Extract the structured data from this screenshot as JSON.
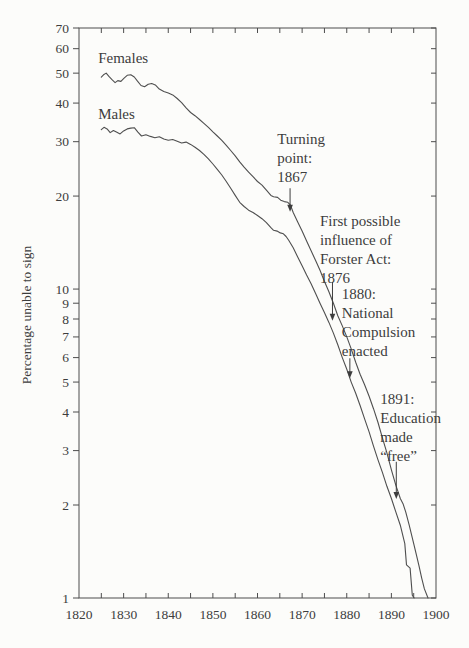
{
  "chart_data": {
    "type": "line",
    "title": "",
    "xlabel": "",
    "ylabel": "Percentage unable to sign",
    "xlim": [
      1820,
      1900
    ],
    "ylim": [
      1,
      70
    ],
    "yscale": "log",
    "grid": false,
    "legend_position": "inline-labels",
    "x_ticks_labeled": [
      1820,
      1830,
      1840,
      1850,
      1860,
      1870,
      1880,
      1890,
      1900
    ],
    "x_ticks_all": [
      1825,
      1830,
      1835,
      1840,
      1845,
      1850,
      1855,
      1860,
      1865,
      1870,
      1875,
      1880,
      1885,
      1890,
      1895
    ],
    "y_ticks": [
      70,
      60,
      50,
      40,
      30,
      20,
      10,
      9,
      8,
      7,
      6,
      5,
      4,
      3,
      2,
      1
    ],
    "colors": {
      "line": "#4f4f4f",
      "frame": "#4d4d4d",
      "text": "#3d3d3d",
      "background": "#fcfcfa"
    },
    "series": [
      {
        "name": "Females",
        "label_anchor": {
          "year": 1824.3,
          "value": 59.5
        },
        "points": [
          [
            1825,
            48.5
          ],
          [
            1825.5,
            49.4
          ],
          [
            1826.1,
            50
          ],
          [
            1826.7,
            48.8
          ],
          [
            1827.4,
            47.6
          ],
          [
            1828.1,
            46.6
          ],
          [
            1828.7,
            47.3
          ],
          [
            1829.4,
            47
          ],
          [
            1830.1,
            48.2
          ],
          [
            1830.8,
            49.2
          ],
          [
            1831.6,
            49.4
          ],
          [
            1832.4,
            48.6
          ],
          [
            1833.1,
            47.1
          ],
          [
            1833.9,
            45.6
          ],
          [
            1834.7,
            45.2
          ],
          [
            1835.5,
            46
          ],
          [
            1836.3,
            46.3
          ],
          [
            1837.1,
            45.8
          ],
          [
            1838,
            44.4
          ],
          [
            1839,
            43.6
          ],
          [
            1840,
            43.1
          ],
          [
            1841,
            42.5
          ],
          [
            1842,
            41.4
          ],
          [
            1843,
            40.1
          ],
          [
            1844,
            38.6
          ],
          [
            1845,
            37.3
          ],
          [
            1846,
            36.4
          ],
          [
            1847,
            35.4
          ],
          [
            1848,
            34.4
          ],
          [
            1849,
            33.4
          ],
          [
            1850,
            32.3
          ],
          [
            1851,
            31.3
          ],
          [
            1852,
            30.3
          ],
          [
            1853,
            29.2
          ],
          [
            1854,
            28.1
          ],
          [
            1855,
            27
          ],
          [
            1856,
            25.8
          ],
          [
            1857,
            24.8
          ],
          [
            1858,
            23.9
          ],
          [
            1859,
            23.1
          ],
          [
            1860,
            22.3
          ],
          [
            1861,
            21.7
          ],
          [
            1862,
            20.9
          ],
          [
            1863,
            20.1
          ],
          [
            1863.6,
            19.9
          ],
          [
            1864.5,
            19.8
          ],
          [
            1865.2,
            19.4
          ],
          [
            1866,
            19.2
          ],
          [
            1866.8,
            19.1
          ],
          [
            1867.4,
            18.7
          ],
          [
            1868,
            17.7
          ],
          [
            1869,
            16.5
          ],
          [
            1870,
            15.4
          ],
          [
            1871,
            14.3
          ],
          [
            1872,
            13.3
          ],
          [
            1873,
            12.4
          ],
          [
            1874,
            11.5
          ],
          [
            1875,
            10.6
          ],
          [
            1876,
            9.8
          ],
          [
            1877,
            9.0
          ],
          [
            1878,
            8.2
          ],
          [
            1879,
            7.6
          ],
          [
            1880,
            7.0
          ],
          [
            1881,
            6.4
          ],
          [
            1882,
            5.8
          ],
          [
            1883,
            5.3
          ],
          [
            1884,
            4.9
          ],
          [
            1885,
            4.5
          ],
          [
            1886,
            4.1
          ],
          [
            1887,
            3.7
          ],
          [
            1888,
            3.3
          ],
          [
            1889,
            2.95
          ],
          [
            1890,
            2.6
          ],
          [
            1891,
            2.32
          ],
          [
            1892,
            2.1
          ],
          [
            1892.6,
            2.02
          ],
          [
            1893.2,
            1.9
          ],
          [
            1894,
            1.72
          ],
          [
            1895,
            1.5
          ],
          [
            1895.6,
            1.38
          ],
          [
            1896.2,
            1.27
          ],
          [
            1896.8,
            1.16
          ],
          [
            1897.4,
            1.07
          ],
          [
            1898.2,
            1.0
          ]
        ]
      },
      {
        "name": "Males",
        "label_anchor": {
          "year": 1824.3,
          "value": 39
        },
        "points": [
          [
            1825,
            32.8
          ],
          [
            1825.6,
            33.4
          ],
          [
            1826.3,
            33
          ],
          [
            1827,
            32.1
          ],
          [
            1827.7,
            32.6
          ],
          [
            1828.5,
            32.2
          ],
          [
            1829.2,
            31.8
          ],
          [
            1830,
            32.5
          ],
          [
            1830.8,
            33
          ],
          [
            1831.6,
            33.2
          ],
          [
            1832.4,
            33.3
          ],
          [
            1833.2,
            32.2
          ],
          [
            1834,
            31.3
          ],
          [
            1835,
            31.6
          ],
          [
            1836,
            31.2
          ],
          [
            1837,
            30.9
          ],
          [
            1838,
            31.1
          ],
          [
            1839,
            30.6
          ],
          [
            1840,
            30.3
          ],
          [
            1841,
            30.5
          ],
          [
            1842,
            30.1
          ],
          [
            1843,
            29.7
          ],
          [
            1844,
            29.9
          ],
          [
            1845,
            29.4
          ],
          [
            1846,
            28.8
          ],
          [
            1847,
            28.1
          ],
          [
            1848,
            27.3
          ],
          [
            1849,
            26.4
          ],
          [
            1850,
            25.4
          ],
          [
            1851,
            24.4
          ],
          [
            1852,
            23.4
          ],
          [
            1853,
            22.3
          ],
          [
            1854,
            21.2
          ],
          [
            1855,
            20.1
          ],
          [
            1856,
            19.1
          ],
          [
            1857,
            18.5
          ],
          [
            1858,
            18.0
          ],
          [
            1859,
            17.7
          ],
          [
            1860,
            17.3
          ],
          [
            1861,
            16.9
          ],
          [
            1862,
            16.4
          ],
          [
            1863,
            15.8
          ],
          [
            1863.6,
            15.5
          ],
          [
            1864.4,
            15.4
          ],
          [
            1865.1,
            15.2
          ],
          [
            1865.8,
            15.1
          ],
          [
            1866.4,
            14.8
          ],
          [
            1867,
            14.4
          ],
          [
            1868,
            13.6
          ],
          [
            1869,
            12.7
          ],
          [
            1870,
            11.9
          ],
          [
            1871,
            11.1
          ],
          [
            1872,
            10.4
          ],
          [
            1873,
            9.7
          ],
          [
            1874,
            9.0
          ],
          [
            1875,
            8.4
          ],
          [
            1876,
            7.8
          ],
          [
            1877,
            7.2
          ],
          [
            1878,
            6.6
          ],
          [
            1879,
            6.0
          ],
          [
            1880,
            5.5
          ],
          [
            1881,
            5.0
          ],
          [
            1882,
            4.6
          ],
          [
            1883,
            4.2
          ],
          [
            1884,
            3.8
          ],
          [
            1885,
            3.45
          ],
          [
            1886,
            3.1
          ],
          [
            1887,
            2.8
          ],
          [
            1888,
            2.55
          ],
          [
            1889,
            2.3
          ],
          [
            1890,
            2.1
          ],
          [
            1891,
            1.9
          ],
          [
            1892,
            1.72
          ],
          [
            1893,
            1.5
          ],
          [
            1893.4,
            1.28
          ],
          [
            1894.2,
            1.25
          ],
          [
            1894.7,
            1.02
          ],
          [
            1895.1,
            1.0
          ]
        ]
      }
    ],
    "annotations": [
      {
        "id": "turning-point",
        "lines": [
          "Turning",
          "point:",
          "1867"
        ],
        "text_anchor": {
          "year": 1864.4,
          "value": 32.7
        },
        "arrow": {
          "year": 1867.3,
          "from_value": 21.2,
          "to_value": 17.8
        }
      },
      {
        "id": "forster-act",
        "lines": [
          "First possible",
          "influence of",
          "Forster Act:",
          "1876"
        ],
        "text_anchor": {
          "year": 1874.0,
          "value": 17.8
        },
        "arrow": {
          "year": 1876.8,
          "from_value": 10.55,
          "to_value": 7.9
        }
      },
      {
        "id": "national-compulsion",
        "lines": [
          "1880:",
          "National",
          "Compulsion",
          "enacted"
        ],
        "text_anchor": {
          "year": 1878.9,
          "value": 10.3
        },
        "arrow": {
          "year": 1880.7,
          "from_value": 5.97,
          "to_value": 5.14
        }
      },
      {
        "id": "education-free",
        "lines": [
          "1891:",
          "Education",
          "made",
          "“free”"
        ],
        "text_anchor": {
          "year": 1887.5,
          "value": 4.72
        },
        "arrow": {
          "year": 1891.1,
          "from_value": 2.76,
          "to_value": 2.09
        }
      }
    ]
  }
}
